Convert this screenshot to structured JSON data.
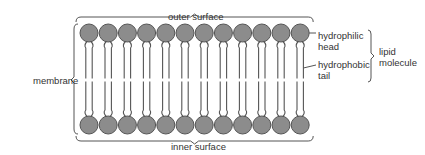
{
  "diagram": {
    "labels": {
      "outer_surface": "outer surface",
      "inner_surface": "inner surface",
      "membrane": "membrane",
      "hydrophilic_head_line1": "hydrophilic",
      "hydrophilic_head_line2": "head",
      "hydrophobic_tail_line1": "hydrophobic",
      "hydrophobic_tail_line2": "tail",
      "lipid_molecule_line1": "lipid",
      "lipid_molecule_line2": "molecule"
    },
    "layers": [
      {
        "name": "outer leaflet",
        "head_count": 12,
        "head_y": 33
      },
      {
        "name": "inner leaflet",
        "head_count": 12,
        "head_y": 125
      }
    ],
    "geometry": {
      "first_head_x": 89,
      "head_spacing": 19.2,
      "head_radius": 9,
      "midline_y": 80
    },
    "colors": {
      "head_fill": "#8c8c8c",
      "head_stroke": "#555555",
      "line": "#555555",
      "text": "#333333"
    }
  }
}
